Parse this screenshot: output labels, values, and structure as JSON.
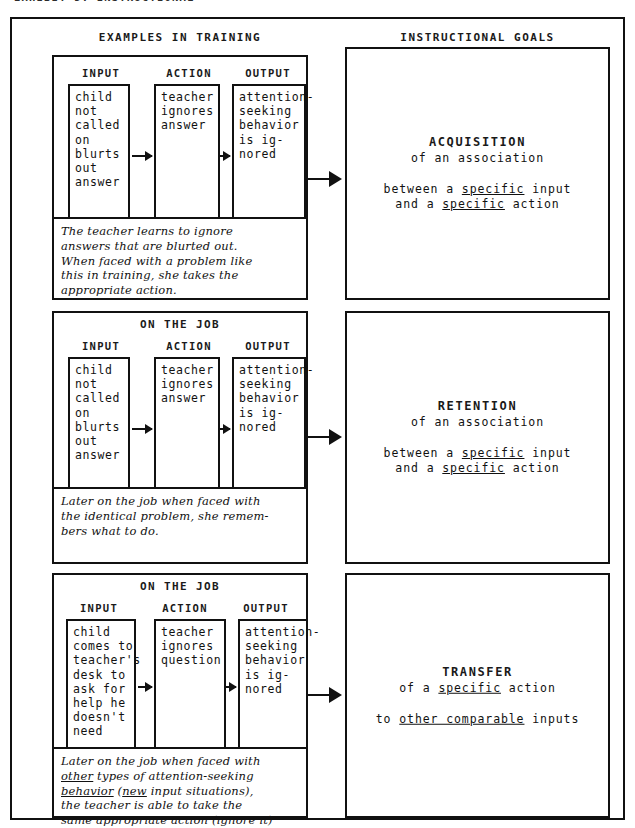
{
  "top_cropped_caption": "EXHIBIT 5: INSTRUCTIONAL",
  "headers": {
    "left": "EXAMPLES IN TRAINING",
    "right": "INSTRUCTIONAL GOALS"
  },
  "column_labels": {
    "input": "INPUT",
    "action": "ACTION",
    "output": "OUTPUT"
  },
  "sections": [
    {
      "on_the_job_label": "",
      "input": "child\nnot\ncalled\non\nblurts\nout\nanswer",
      "action": "teacher\nignores\nanswer",
      "output": "attention-\nseeking\nbehavior\nis ig-\nnored",
      "caption_line1": "The teacher learns to ignore",
      "caption_line2": "answers that are blurted out.",
      "caption_line3": "When faced with a problem like",
      "caption_line4": "this in training, she takes the",
      "caption_line5": "appropriate action.",
      "goal_title": "ACQUISITION",
      "goal_sub": "of an association",
      "goal_detail_line1_pre": "between a ",
      "goal_detail_line1_underlined": "specific",
      "goal_detail_line1_post": " input",
      "goal_detail_line2_pre": "and a ",
      "goal_detail_line2_underlined": "specific",
      "goal_detail_line2_post": " action"
    },
    {
      "on_the_job_label": "ON THE JOB",
      "input": "child\nnot\ncalled\non\nblurts\nout\nanswer",
      "action": "teacher\nignores\nanswer",
      "output": "attention-\nseeking\nbehavior\nis ig-\nnored",
      "caption_line1": "Later on the job when faced with",
      "caption_line2": "the identical problem, she remem-",
      "caption_line3": "bers what to do.",
      "caption_line4": "",
      "caption_line5": "",
      "goal_title": "RETENTION",
      "goal_sub": "of an association",
      "goal_detail_line1_pre": "between a ",
      "goal_detail_line1_underlined": "specific",
      "goal_detail_line1_post": " input",
      "goal_detail_line2_pre": "and a ",
      "goal_detail_line2_underlined": "specific",
      "goal_detail_line2_post": " action"
    },
    {
      "on_the_job_label": "ON THE JOB",
      "input": "child\ncomes to\nteacher's\ndesk to\nask for\nhelp he\ndoesn't\nneed",
      "action": "teacher\nignores\nquestion",
      "output": "attention-\nseeking\nbehavior\nis ig-\nnored",
      "caption_line1": "Later on the job when faced with",
      "caption_line2": "other types of attention-seeking",
      "caption_line3": "behavior (new input situations),",
      "caption_line4": "the teacher is able to take the",
      "caption_line5": "same appropriate action (ignore it)",
      "goal_title": "TRANSFER",
      "goal_sub_pre": "of a ",
      "goal_sub_underlined": "specific",
      "goal_sub_post": " action",
      "goal_detail_line1_pre": "to ",
      "goal_detail_line1_underlined": "other comparable",
      "goal_detail_line1_post": " inputs"
    }
  ],
  "colors": {
    "ink": "#111111",
    "paper": "#ffffff"
  }
}
